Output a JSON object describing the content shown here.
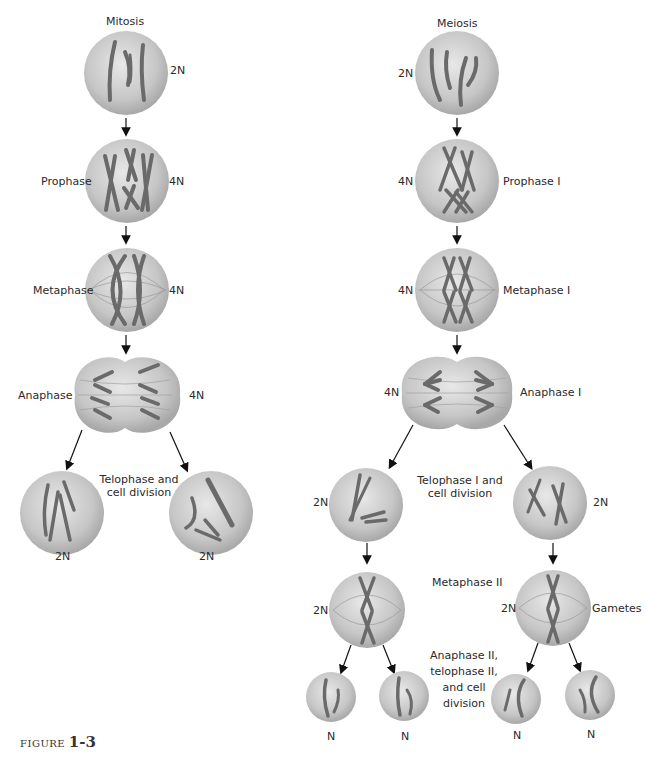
{
  "mitosis": {
    "title": "Mitosis",
    "stages": [
      {
        "label": "",
        "ploidy": "2N"
      },
      {
        "label": "Prophase",
        "ploidy": "4N"
      },
      {
        "label": "Metaphase",
        "ploidy": "4N"
      },
      {
        "label": "Anaphase",
        "ploidy": "4N"
      }
    ],
    "telophase_label_line1": "Telophase and",
    "telophase_label_line2": "cell division",
    "daughter_ploidy_left": "2N",
    "daughter_ploidy_right": "2N"
  },
  "meiosis": {
    "title": "Meiosis",
    "stages": [
      {
        "label": "",
        "ploidy": "2N"
      },
      {
        "label": "Prophase I",
        "ploidy": "4N"
      },
      {
        "label": "Metaphase I",
        "ploidy": "4N"
      },
      {
        "label": "Anaphase I",
        "ploidy": "4N"
      }
    ],
    "telophase1_line1": "Telophase I and",
    "telophase1_line2": "cell division",
    "daughter_ploidy_left": "2N",
    "daughter_ploidy_right": "2N",
    "metaphase2_label": "Metaphase II",
    "metaphase2_ploidy_left": "2N",
    "metaphase2_ploidy_right": "2N",
    "gametes_label": "Gametes",
    "anaphase2_line1": "Anaphase II,",
    "anaphase2_line2": "telophase II,",
    "anaphase2_line3": "and cell",
    "anaphase2_line4": "division",
    "gamete_ploidy": [
      "N",
      "N",
      "N",
      "N"
    ]
  },
  "caption": {
    "prefix": "FIGURE",
    "number": "1-3"
  },
  "colors": {
    "cell_fill": "#c9c9c9",
    "cell_edge": "#9a9a9a",
    "chromosome": "#6a6a6a",
    "arrow": "#111111"
  }
}
